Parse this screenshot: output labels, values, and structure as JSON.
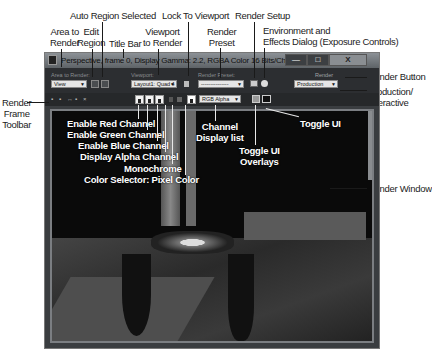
{
  "window": {
    "title": "Perspective, frame 0, Display Gamma: 2.2, RGBA Color 16 Bits/Channel (1:1)",
    "controls": {
      "minimize": "—",
      "maximize": "□",
      "close": "X"
    }
  },
  "toolbar": {
    "area_label": "Area to Render:",
    "area_value": "View",
    "viewport_label": "Viewport:",
    "viewport_value": "Layout1: Quad 4",
    "preset_label": "Render Preset:",
    "preset_value": "---------------",
    "render_label": "Render",
    "mode_value": "Production",
    "channel_value": "RGB Alpha"
  },
  "callouts": {
    "auto_region": "Auto Region Selected",
    "area_to_render": "Area to\nRender",
    "edit_region": "Edit\nRegion",
    "title_bar": "Title Bar",
    "viewport_to_render": "Viewport\nto Render",
    "lock_to_viewport": "Lock To Viewport",
    "render_preset": "Render\nPreset",
    "render_setup": "Render Setup",
    "environment": "Environment and\nEffects Dialog (Exposure Controls)",
    "render_button": "Render Button",
    "production_interactive": "Production/\nInteractive",
    "render_frame_toolbar": "Render\nFrame\nToolbar",
    "enable_red": "Enable Red Channel",
    "enable_green": "Enable Green Channel",
    "enable_blue": "Enable Blue Channel",
    "display_alpha": "Display Alpha Channel",
    "monochrome": "Monochrome",
    "color_selector": "Color Selector: Pixel Color",
    "channel_display_list": "Channel\nDisplay list",
    "toggle_ui_overlays": "Toggle UI\nOverlays",
    "toggle_ui": "Toggle UI",
    "render_window": "Render Window"
  }
}
